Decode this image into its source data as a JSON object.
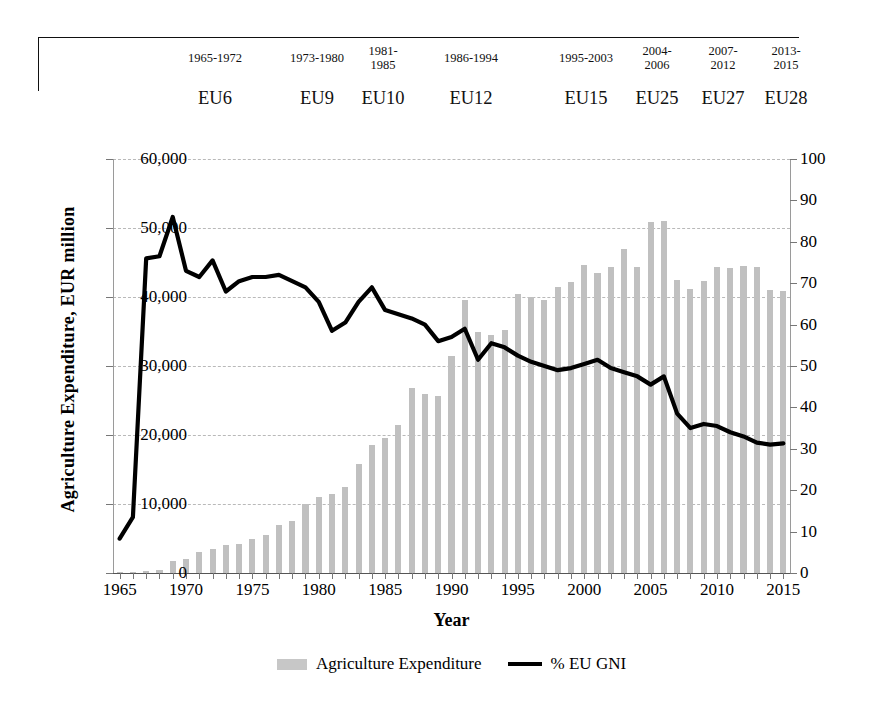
{
  "era_header": {
    "periods": [
      {
        "range": "1965-1972",
        "name": "EU6",
        "range_two_line": false,
        "left": 160,
        "width": 110,
        "name_left": 160,
        "name_width": 110
      },
      {
        "range": "1973-1980",
        "name": "EU9",
        "range_two_line": false,
        "left": 262,
        "width": 110,
        "name_left": 262,
        "name_width": 110
      },
      {
        "range": "1981-1985",
        "name": "EU10",
        "range_two_line": true,
        "left": 352,
        "width": 62,
        "name_left": 342,
        "name_width": 82
      },
      {
        "range": "1986-1994",
        "name": "EU12",
        "range_two_line": false,
        "left": 416,
        "width": 110,
        "name_left": 416,
        "name_width": 110
      },
      {
        "range": "1995-2003",
        "name": "EU15",
        "range_two_line": false,
        "left": 531,
        "width": 110,
        "name_left": 531,
        "name_width": 110
      },
      {
        "range": "2004-2006",
        "name": "EU25",
        "range_two_line": true,
        "left": 627,
        "width": 60,
        "name_left": 617,
        "name_width": 80
      },
      {
        "range": "2007-2012",
        "name": "EU27",
        "range_two_line": true,
        "left": 693,
        "width": 60,
        "name_left": 683,
        "name_width": 80
      },
      {
        "range": "2013-2015",
        "name": "EU28",
        "range_two_line": true,
        "left": 756,
        "width": 60,
        "name_left": 746,
        "name_width": 80
      }
    ]
  },
  "chart_data": {
    "type": "bar",
    "title": "",
    "xlabel": "Year",
    "ylabel": "Agriculture  Expenditure,  EUR million",
    "ylabel_right": "",
    "xlim": [
      1965,
      2015
    ],
    "ylim": [
      0,
      60000
    ],
    "ylim_right": [
      0,
      100
    ],
    "ytick_labels": [
      "0",
      "10,000",
      "20,000",
      "30,000",
      "40,000",
      "50,000",
      "60,000"
    ],
    "ytick_values": [
      0,
      10000,
      20000,
      30000,
      40000,
      50000,
      60000
    ],
    "ytick_right_labels": [
      "0",
      "10",
      "20",
      "30",
      "40",
      "50",
      "60",
      "70",
      "80",
      "90",
      "100"
    ],
    "ytick_right_values": [
      0,
      10,
      20,
      30,
      40,
      50,
      60,
      70,
      80,
      90,
      100
    ],
    "xtick_labels": [
      "1965",
      "1970",
      "1975",
      "1980",
      "1985",
      "1990",
      "1995",
      "2000",
      "2005",
      "2010",
      "2015"
    ],
    "xtick_values": [
      1965,
      1970,
      1975,
      1980,
      1985,
      1990,
      1995,
      2000,
      2005,
      2010,
      2015
    ],
    "grid": true,
    "legend_position": "bottom",
    "x": [
      1965,
      1966,
      1967,
      1968,
      1969,
      1970,
      1971,
      1972,
      1973,
      1974,
      1975,
      1976,
      1977,
      1978,
      1979,
      1980,
      1981,
      1982,
      1983,
      1984,
      1985,
      1986,
      1987,
      1988,
      1989,
      1990,
      1991,
      1992,
      1993,
      1994,
      1995,
      1996,
      1997,
      1998,
      1999,
      2000,
      2001,
      2002,
      2003,
      2004,
      2005,
      2006,
      2007,
      2008,
      2009,
      2010,
      2011,
      2012,
      2013,
      2014,
      2015
    ],
    "series": [
      {
        "name": "Agriculture Expenditure",
        "axis": "left",
        "color": "#c0c0c0",
        "type": "bar",
        "values": [
          100,
          200,
          300,
          400,
          1800,
          2000,
          3000,
          3500,
          4000,
          4200,
          5000,
          5500,
          7000,
          7600,
          10000,
          11000,
          11500,
          12500,
          15800,
          18500,
          19500,
          21500,
          26800,
          26000,
          25700,
          31500,
          39500,
          35000,
          34500,
          35200,
          40500,
          40000,
          39500,
          41500,
          42200,
          44700,
          43500,
          44300,
          47000,
          44400,
          50800,
          51000,
          42500,
          41200,
          42300,
          44300,
          44200,
          44500,
          44400,
          41000,
          40900
        ]
      },
      {
        "name": "% EU GNI",
        "axis": "right",
        "color": "#000000",
        "type": "line",
        "values": [
          8.3,
          13.5,
          76.0,
          76.5,
          86.0,
          73.0,
          71.5,
          75.5,
          68.0,
          70.5,
          71.5,
          71.5,
          72.0,
          70.5,
          69.0,
          65.5,
          58.5,
          60.5,
          65.5,
          69.0,
          63.5,
          62.5,
          61.5,
          60.0,
          56.0,
          57.0,
          59.0,
          51.5,
          55.5,
          54.5,
          52.5,
          51.0,
          50.0,
          49.0,
          49.5,
          50.5,
          51.5,
          49.5,
          48.5,
          47.5,
          45.5,
          47.5,
          38.5,
          35.0,
          36.0,
          35.5,
          34.0,
          33.0,
          31.5,
          31.0,
          31.3
        ]
      }
    ],
    "legend": [
      "Agriculture Expenditure",
      "% EU GNI"
    ]
  }
}
